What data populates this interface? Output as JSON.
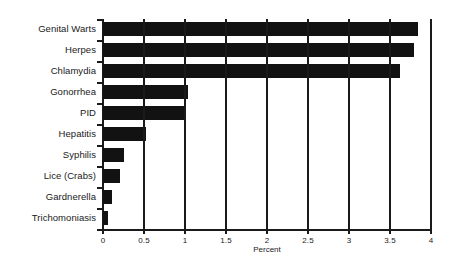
{
  "chart_data": {
    "type": "bar",
    "orientation": "horizontal",
    "title": "",
    "xlabel": "Percent",
    "ylabel": "",
    "xlim": [
      0,
      4
    ],
    "ylim": null,
    "grid": true,
    "legend": false,
    "legend_position": "none",
    "bar_color": "#121212",
    "axis_color": "#1a1a1a",
    "background_color": "#ffffff",
    "xticks": [
      "0",
      "0.5",
      "1",
      "1.5",
      "2",
      "2.5",
      "3",
      "3.5",
      "4"
    ],
    "xtick_values": [
      0,
      0.5,
      1,
      1.5,
      2,
      2.5,
      3,
      3.5,
      4
    ],
    "gridline_values": [
      0.5,
      1,
      1.5,
      2,
      2.5,
      3,
      3.5
    ],
    "categories": [
      "Genital Warts",
      "Herpes",
      "Chlamydia",
      "Gonorrhea",
      "PID",
      "Hepatitis",
      "Syphilis",
      "Lice (Crabs)",
      "Gardnerella",
      "Trichomoniasis"
    ],
    "values": [
      3.84,
      3.79,
      3.62,
      1.04,
      1.0,
      0.52,
      0.26,
      0.21,
      0.11,
      0.06
    ]
  }
}
